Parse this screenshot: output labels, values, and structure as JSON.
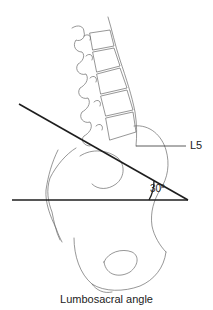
{
  "figure": {
    "labels": {
      "vertebra": "L5",
      "angle": "30°"
    },
    "caption": "Lumbosacral angle",
    "colors": {
      "bone_outline": "#6a6a6a",
      "reference_lines": "#1e1e1e",
      "background": "#ffffff"
    }
  }
}
